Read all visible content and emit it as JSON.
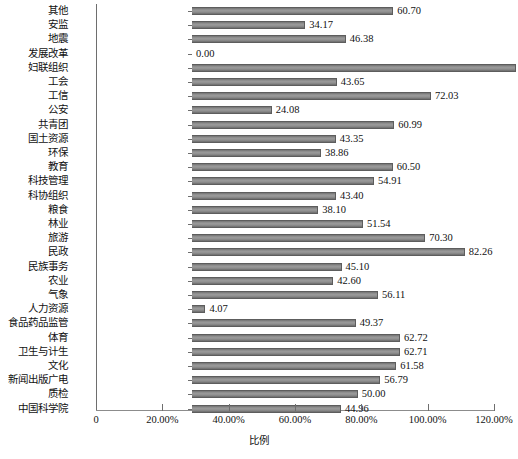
{
  "chart_data": {
    "type": "bar",
    "orientation": "horizontal",
    "title": "",
    "xlabel": "比例",
    "ylabel": "",
    "xlim": [
      0,
      120
    ],
    "xtick_labels": [
      "0",
      "20.00%",
      "40.00%",
      "60.00%",
      "80.00%",
      "100.00%",
      "120.00%"
    ],
    "xtick_values": [
      0,
      20,
      40,
      60,
      80,
      100,
      120
    ],
    "grid": false,
    "legend": null,
    "bar_color": "#8a8a8a",
    "bar_edge_color": "#5d5d5d",
    "value_label_format": "two-decimals",
    "categories": [
      "其他",
      "安监",
      "地震",
      "发展改革",
      "妇联组织",
      "工会",
      "工信",
      "公安",
      "共青团",
      "国土资源",
      "环保",
      "教育",
      "科技管理",
      "科协组织",
      "粮食",
      "林业",
      "旅游",
      "民政",
      "民族事务",
      "农业",
      "气象",
      "人力资源",
      "食品药品监管",
      "体育",
      "卫生与计生",
      "文化",
      "新闻出版广电",
      "质检",
      "中国科学院"
    ],
    "values": [
      60.7,
      34.17,
      46.38,
      0.0,
      97.73,
      43.65,
      72.03,
      24.08,
      60.99,
      43.35,
      38.86,
      60.5,
      54.91,
      43.4,
      38.1,
      51.54,
      70.3,
      82.26,
      45.1,
      42.6,
      56.11,
      4.07,
      49.37,
      62.72,
      62.71,
      61.58,
      56.79,
      50.0,
      44.96
    ],
    "value_labels": [
      "60.70",
      "34.17",
      "46.38",
      "0.00",
      "97.73",
      "43.65",
      "72.03",
      "24.08",
      "60.99",
      "43.35",
      "38.86",
      "60.50",
      "54.91",
      "43.40",
      "38.10",
      "51.54",
      "70.30",
      "82.26",
      "45.10",
      "42.60",
      "56.11",
      "4.07",
      "49.37",
      "62.72",
      "62.71",
      "61.58",
      "56.79",
      "50.00",
      "44.96"
    ]
  }
}
